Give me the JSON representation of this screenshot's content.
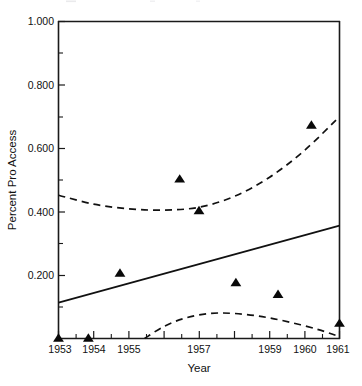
{
  "figure": {
    "background_color": "#ffffff",
    "ink_color": "#111111"
  },
  "axes": {
    "y_axis_title": "Percent Pro Access",
    "x_axis_title": "Year",
    "y_tick_labels": [
      "1.000",
      "0.800",
      "0.600",
      "0.400",
      "0.200"
    ],
    "x_tick_labels": [
      "1953",
      "1954",
      "1955",
      "1957",
      "1959",
      "1960",
      "1961"
    ]
  },
  "chart_data": {
    "type": "scatter",
    "title": "",
    "xlabel": "Year",
    "ylabel": "Percent Pro Access",
    "xlim": [
      1953,
      1961
    ],
    "ylim": [
      0,
      1.0
    ],
    "grid": false,
    "legend": "none",
    "x_ticks": [
      1953,
      1954,
      1955,
      1956,
      1957,
      1958,
      1959,
      1960,
      1961
    ],
    "x_tick_labels": [
      "1953",
      "1954",
      "1955",
      "",
      "1957",
      "",
      "1959",
      "1960",
      "1961"
    ],
    "x_minor_ticks": [
      1953.5,
      1954.5,
      1955.5,
      1956.5,
      1957.5,
      1958.5,
      1959.5,
      1960.5
    ],
    "y_ticks": [
      0.2,
      0.4,
      0.6,
      0.8,
      1.0
    ],
    "y_tick_labels": [
      "0.200",
      "0.400",
      "0.600",
      "0.800",
      "1.000"
    ],
    "y_minor_ticks": [
      0.1,
      0.3,
      0.5,
      0.7,
      0.9
    ],
    "series": [
      {
        "name": "observations",
        "type": "scatter",
        "marker": "triangle-up",
        "marker_color": "#090909",
        "points": [
          {
            "x": 1953.0,
            "y": 0.0
          },
          {
            "x": 1953.85,
            "y": 0.0
          },
          {
            "x": 1954.75,
            "y": 0.205
          },
          {
            "x": 1956.45,
            "y": 0.502
          },
          {
            "x": 1957.0,
            "y": 0.402
          },
          {
            "x": 1958.05,
            "y": 0.175
          },
          {
            "x": 1959.25,
            "y": 0.138
          },
          {
            "x": 1960.2,
            "y": 0.672
          },
          {
            "x": 1961.0,
            "y": 0.047
          }
        ]
      },
      {
        "name": "regression-line",
        "type": "line",
        "style": "solid",
        "color": "#111111",
        "points": [
          {
            "x": 1953.0,
            "y": 0.113
          },
          {
            "x": 1961.0,
            "y": 0.356
          }
        ]
      },
      {
        "name": "upper-confidence-band",
        "type": "line",
        "style": "dashed",
        "color": "#111111",
        "points": [
          {
            "x": 1953.0,
            "y": 0.452
          },
          {
            "x": 1954.0,
            "y": 0.424
          },
          {
            "x": 1955.0,
            "y": 0.409
          },
          {
            "x": 1956.0,
            "y": 0.405
          },
          {
            "x": 1957.0,
            "y": 0.414
          },
          {
            "x": 1958.0,
            "y": 0.448
          },
          {
            "x": 1959.0,
            "y": 0.508
          },
          {
            "x": 1960.0,
            "y": 0.593
          },
          {
            "x": 1961.0,
            "y": 0.7
          }
        ]
      },
      {
        "name": "lower-confidence-band",
        "type": "line",
        "style": "dashed",
        "color": "#111111",
        "points": [
          {
            "x": 1955.45,
            "y": 0.0
          },
          {
            "x": 1956.0,
            "y": 0.038
          },
          {
            "x": 1956.6,
            "y": 0.064
          },
          {
            "x": 1957.3,
            "y": 0.079
          },
          {
            "x": 1958.0,
            "y": 0.079
          },
          {
            "x": 1958.8,
            "y": 0.069
          },
          {
            "x": 1959.6,
            "y": 0.051
          },
          {
            "x": 1960.4,
            "y": 0.028
          },
          {
            "x": 1961.0,
            "y": 0.006
          }
        ]
      }
    ]
  }
}
